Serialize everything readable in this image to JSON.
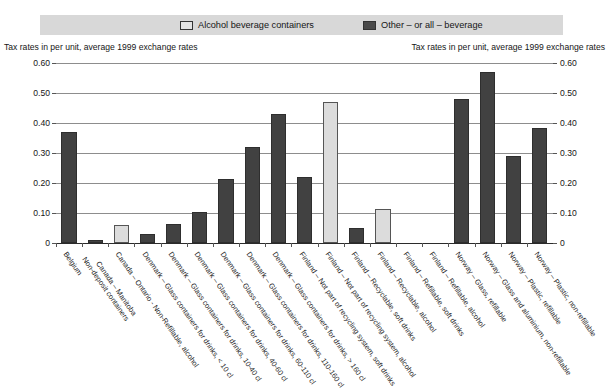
{
  "legend": {
    "entries": [
      {
        "label": "Alcohol beverage containers",
        "swatch": "light",
        "color": "#e3e3e3"
      },
      {
        "label": "Other – or all – beverage",
        "swatch": "dark",
        "color": "#4a4a4a"
      }
    ]
  },
  "axis_caption_left": "Tax rates in per unit, average 1999 exchange rates",
  "axis_caption_right": "Tax rates in per unit, average 1999 exchange rates",
  "chart_data": {
    "type": "bar",
    "title": "",
    "xlabel": "",
    "ylabel": "Tax rates in per unit, average 1999 exchange rates",
    "ylim": [
      0,
      0.6
    ],
    "yticks": [
      "0",
      "0.10",
      "0.20",
      "0.30",
      "0.40",
      "0.50",
      "0.60"
    ],
    "ytick_values": [
      0,
      0.1,
      0.2,
      0.3,
      0.4,
      0.5,
      0.6
    ],
    "grid": true,
    "legend_position": "top",
    "dual_axis": true,
    "categories": [
      "Belgium",
      "Canada – Manitoba\nNon-deposit containers",
      "Canada – Ontario - Non-Refillable, alcohol",
      "Denmark – Glass containers for drinks, < 10 cl",
      "Denmark – Glass containers for drinks, 10-40 cl",
      "Denmark – Glass containers for drinks, 40-60 cl",
      "Denmark – Glass containers for drinks, 60-110 cl",
      "Denmark – Glass containers for drinks, 110-160 cl",
      "Denmark – Glass containers for drinks, > 160 cl",
      "Finland – Not part of recycling system, soft drinks",
      "Finland – Not part of recycling system, alcohol",
      "Finland – Recyclable, soft drinks",
      "Finland – Recyclable, alcohol",
      "Finland – Refillable, soft drinks",
      "Finland – Refillable, alcohol",
      "Norway – Glass, refillable",
      "Norway – Glass and aluminium, non-refillable",
      "Norway – Plastic, refillable",
      "Norway – Plastic, non-refillable"
    ],
    "values": [
      0.37,
      0.01,
      0.06,
      0.03,
      0.065,
      0.105,
      0.215,
      0.32,
      0.43,
      0.22,
      0.47,
      0.05,
      0.115,
      0,
      0,
      0.48,
      0.57,
      0.29,
      0.385
    ],
    "series_of": [
      "other",
      "other",
      "alcohol",
      "other",
      "other",
      "other",
      "other",
      "other",
      "other",
      "other",
      "alcohol",
      "other",
      "alcohol",
      "other",
      "alcohol",
      "other",
      "other",
      "other",
      "other"
    ]
  },
  "colors": {
    "dark": "#414141",
    "light": "#dcdcdc",
    "legend_band": "#d8d8d8",
    "grid": "#8d8d8d"
  }
}
